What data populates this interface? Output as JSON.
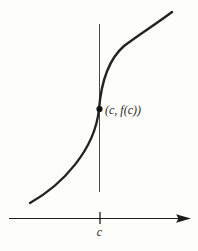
{
  "figure": {
    "point_label": "(c, f(c))",
    "axis_tick_label": "c",
    "colors": {
      "background": "#fdfdfa",
      "curve": "#222222",
      "vertical_line": "#4a4a4a",
      "axis": "#1c1c1c",
      "dot": "#111111",
      "text": "#2b2b2b"
    }
  }
}
